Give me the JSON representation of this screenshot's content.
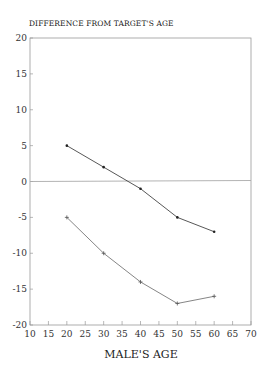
{
  "chart_data": {
    "type": "line",
    "title": "DIFFERENCE FROM TARGET'S AGE",
    "xlabel": "MALE'S AGE",
    "ylabel": "",
    "xlim": [
      10,
      70
    ],
    "ylim": [
      -20,
      20
    ],
    "xticks": [
      10,
      15,
      20,
      25,
      30,
      35,
      40,
      45,
      50,
      55,
      60,
      65,
      70
    ],
    "yticks": [
      -20,
      -15,
      -10,
      -5,
      0,
      5,
      10,
      15,
      20
    ],
    "x": [
      20,
      30,
      40,
      50,
      60
    ],
    "reference_line": 0,
    "grid": false,
    "legend": "none",
    "series": [
      {
        "name": "upper",
        "marker": "dot",
        "color": "#444444",
        "values": [
          5,
          2,
          -1,
          -5,
          -7
        ]
      },
      {
        "name": "lower",
        "marker": "plus",
        "color": "#777777",
        "values": [
          -5,
          -10,
          -14,
          -17,
          -16
        ]
      }
    ]
  }
}
